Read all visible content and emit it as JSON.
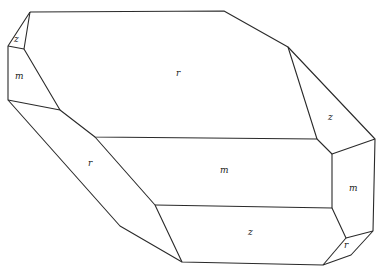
{
  "diagram": {
    "face_labels": [
      {
        "id": "z-top-left",
        "text": "z",
        "x": 17,
        "y": 40
      },
      {
        "id": "m-left",
        "text": "m",
        "x": 20,
        "y": 78
      },
      {
        "id": "r-top",
        "text": "r",
        "x": 178,
        "y": 75
      },
      {
        "id": "z-right",
        "text": "z",
        "x": 330,
        "y": 118
      },
      {
        "id": "r-left",
        "text": "r",
        "x": 90,
        "y": 165
      },
      {
        "id": "m-center",
        "text": "m",
        "x": 225,
        "y": 172
      },
      {
        "id": "m-right",
        "text": "m",
        "x": 354,
        "y": 190
      },
      {
        "id": "z-bottom",
        "text": "z",
        "x": 251,
        "y": 234
      },
      {
        "id": "r-bottom-right",
        "text": "r",
        "x": 346,
        "y": 246
      }
    ],
    "colors": {
      "line": "#2a2a2a",
      "background": "#ffffff"
    }
  }
}
